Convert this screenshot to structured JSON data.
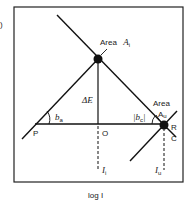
{
  "figure": {
    "panel_marker": ")",
    "x_axis_label": "log I",
    "labels": {
      "area_i_word": "Area",
      "area_i_symbol": "A",
      "area_i_sub": "i",
      "area_u_word": "Area",
      "area_u_symbol": "A",
      "area_u_sub": "u",
      "delta_e": "ΔE",
      "b_a": "b",
      "b_a_sub": "a",
      "b_c": "|b",
      "b_c_sub": "c",
      "b_c_close": "|",
      "point_p": "P",
      "point_o": "O",
      "point_r": "R",
      "point_c": "C",
      "i_i": "I",
      "i_i_sub": "i",
      "i_u": "I",
      "i_u_sub": "u"
    },
    "colors": {
      "line": "#111111",
      "frame": "#222222",
      "background": "#ffffff"
    }
  }
}
